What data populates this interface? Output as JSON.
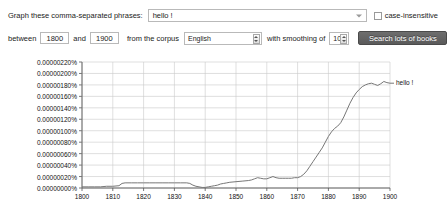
{
  "query": {
    "phrases_label": "Graph these comma-separated phrases:",
    "phrases_value": "hello !",
    "phrases_placeholder": "",
    "case_insensitive_label": "case-insensitive",
    "case_insensitive_checked": false,
    "between_label": "between",
    "year_start": "1800",
    "and_label": "and",
    "year_end": "1900",
    "corpus_label": "from the corpus",
    "corpus_value": "English",
    "smoothing_label": "with smoothing of",
    "smoothing_value": "10",
    "search_button": "Search lots of books"
  },
  "chart_data": {
    "type": "line",
    "title": "",
    "xlabel": "",
    "ylabel": "",
    "xlim": [
      1800,
      1900
    ],
    "ylim": [
      0,
      2.2e-06
    ],
    "grid": true,
    "legend_position": "right",
    "y_ticks": [
      "0.00000220%",
      "0.00000200%",
      "0.00000180%",
      "0.00000160%",
      "0.00000140%",
      "0.00000120%",
      "0.00000100%",
      "0.00000080%",
      "0.00000060%",
      "0.00000040%",
      "0.00000020%",
      "0.00000000%"
    ],
    "y_tick_values": [
      2.2e-06,
      2e-06,
      1.8e-06,
      1.6e-06,
      1.4e-06,
      1.2e-06,
      1e-06,
      8e-07,
      6e-07,
      4e-07,
      2e-07,
      0.0
    ],
    "x_ticks": [
      "1800",
      "1810",
      "1820",
      "1830",
      "1840",
      "1850",
      "1860",
      "1870",
      "1880",
      "1890",
      "1900"
    ],
    "x_tick_values": [
      1800,
      1810,
      1820,
      1830,
      1840,
      1850,
      1860,
      1870,
      1880,
      1890,
      1900
    ],
    "series": [
      {
        "name": "hello !",
        "color": "#777777",
        "x": [
          1800,
          1802,
          1804,
          1806,
          1808,
          1810,
          1812,
          1813,
          1814,
          1816,
          1818,
          1820,
          1822,
          1824,
          1826,
          1828,
          1830,
          1832,
          1834,
          1835,
          1836,
          1837,
          1838,
          1839,
          1840,
          1841,
          1842,
          1843,
          1844,
          1845,
          1846,
          1847,
          1848,
          1850,
          1852,
          1854,
          1855,
          1856,
          1857,
          1858,
          1859,
          1860,
          1861,
          1862,
          1863,
          1864,
          1865,
          1866,
          1867,
          1868,
          1869,
          1870,
          1871,
          1872,
          1873,
          1874,
          1875,
          1876,
          1877,
          1878,
          1879,
          1880,
          1881,
          1882,
          1883,
          1884,
          1885,
          1886,
          1887,
          1888,
          1889,
          1890,
          1891,
          1892,
          1893,
          1894,
          1895,
          1896,
          1897,
          1898,
          1899,
          1900
        ],
        "y": [
          2e-08,
          2e-08,
          2e-08,
          2e-08,
          3e-08,
          3e-08,
          4e-08,
          8e-08,
          9e-08,
          9e-08,
          9e-08,
          9e-08,
          9e-08,
          9e-08,
          9e-08,
          9e-08,
          9e-08,
          9e-08,
          9e-08,
          8e-08,
          5e-08,
          3e-08,
          2e-08,
          1e-08,
          1e-08,
          2e-08,
          3e-08,
          4e-08,
          5e-08,
          7e-08,
          8e-08,
          9e-08,
          1e-07,
          1.1e-07,
          1.2e-07,
          1.3e-07,
          1.4e-07,
          1.6e-07,
          1.8e-07,
          1.7e-07,
          1.6e-07,
          1.6e-07,
          1.8e-07,
          2e-07,
          1.8e-07,
          1.7e-07,
          1.7e-07,
          1.7e-07,
          1.7e-07,
          1.7e-07,
          1.8e-07,
          1.8e-07,
          2e-07,
          2.4e-07,
          3e-07,
          3.8e-07,
          4.6e-07,
          5.4e-07,
          6.2e-07,
          7e-07,
          8e-07,
          9e-07,
          9.8e-07,
          1.04e-06,
          1.08e-06,
          1.14e-06,
          1.24e-06,
          1.36e-06,
          1.48e-06,
          1.58e-06,
          1.66e-06,
          1.72e-06,
          1.77e-06,
          1.8e-06,
          1.82e-06,
          1.83e-06,
          1.81e-06,
          1.79e-06,
          1.82e-06,
          1.86e-06,
          1.84e-06,
          1.83e-06
        ],
        "legend_text": "hello !"
      }
    ]
  }
}
